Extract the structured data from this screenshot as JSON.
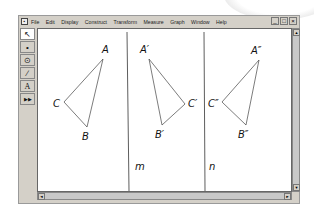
{
  "menubar": {
    "items": [
      "File",
      "Edit",
      "Display",
      "Construct",
      "Transform",
      "Measure",
      "Graph",
      "Window",
      "Help"
    ],
    "window_controls": [
      "_",
      "□",
      "×"
    ]
  },
  "toolbar": {
    "tools": [
      {
        "name": "selection-arrow-tool",
        "glyph": "↖"
      },
      {
        "name": "point-tool",
        "glyph": "•"
      },
      {
        "name": "compass-tool",
        "glyph": "⊙"
      },
      {
        "name": "straightedge-tool",
        "glyph": "∕"
      },
      {
        "name": "text-tool",
        "glyph": "A"
      },
      {
        "name": "custom-tool",
        "glyph": "▶▶"
      }
    ]
  },
  "canvas": {
    "lines": [
      {
        "label": "m"
      },
      {
        "label": "n"
      }
    ],
    "triangles": [
      {
        "name": "original",
        "labels": {
          "A": "A",
          "B": "B",
          "C": "C"
        }
      },
      {
        "name": "first-reflection",
        "labels": {
          "A": "A′",
          "B": "B′",
          "C": "C′"
        }
      },
      {
        "name": "second-reflection",
        "labels": {
          "A": "A″",
          "B": "B″",
          "C": "C″"
        }
      }
    ]
  },
  "scrollbars": {
    "up": "▲",
    "down": "▼",
    "left": "◄",
    "right": "►"
  }
}
